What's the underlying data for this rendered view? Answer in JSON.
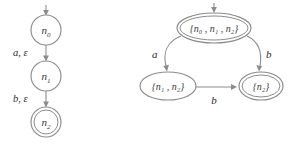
{
  "figure": {
    "title": "",
    "stroke_color": "#8c8c8c",
    "text_color": "#2b2b2b",
    "background": "#ffffff"
  },
  "diagrams": [
    {
      "id": "nfa-epsilon",
      "name": "left-nfa-diagram",
      "states": [
        {
          "id": "n0",
          "label": "n",
          "sub": "0",
          "accepting": false,
          "start": true,
          "cx": 46,
          "cy": 30,
          "r": 15
        },
        {
          "id": "n1",
          "label": "n",
          "sub": "1",
          "accepting": false,
          "start": false,
          "cx": 46,
          "cy": 76,
          "r": 15
        },
        {
          "id": "n2",
          "label": "n",
          "sub": "2",
          "accepting": true,
          "start": false,
          "cx": 46,
          "cy": 122,
          "r": 15
        }
      ],
      "transitions": [
        {
          "from": "n0",
          "to": "n1",
          "label": "a, ε",
          "label_x": 13,
          "label_y": 54
        },
        {
          "from": "n1",
          "to": "n2",
          "label": "b, ε",
          "label_x": 13,
          "label_y": 100
        }
      ]
    },
    {
      "id": "dfa-subset",
      "name": "right-dfa-diagram",
      "states": [
        {
          "id": "s0",
          "label": "{n₀ , n₁ , n₂}",
          "members": [
            "n0",
            "n1",
            "n2"
          ],
          "accepting": true,
          "start": true,
          "cx": 214,
          "cy": 28,
          "rx": 37,
          "ry": 15
        },
        {
          "id": "s1",
          "label": "{n₁ , n₂}",
          "members": [
            "n1",
            "n2"
          ],
          "accepting": false,
          "start": false,
          "cx": 168,
          "cy": 86,
          "rx": 28,
          "ry": 14
        },
        {
          "id": "s2",
          "label": "{n₂}",
          "members": [
            "n2"
          ],
          "accepting": true,
          "start": false,
          "cx": 261,
          "cy": 86,
          "rx": 22,
          "ry": 14
        }
      ],
      "transitions": [
        {
          "from": "s0",
          "to": "s1",
          "label": "a",
          "label_x": 157,
          "label_y": 54
        },
        {
          "from": "s0",
          "to": "s2",
          "label": "b",
          "label_x": 268,
          "label_y": 54
        },
        {
          "from": "s1",
          "to": "s2",
          "label": "b",
          "label_x": 214,
          "label_y": 103
        }
      ]
    }
  ],
  "labels": {
    "left_edge_1": "a, ε",
    "left_edge_2": "b, ε",
    "right_edge_a": "a",
    "right_edge_b_top": "b",
    "right_edge_b_bottom": "b",
    "n0": "n",
    "n1": "n",
    "n2": "n",
    "sub0": "0",
    "sub1": "1",
    "sub2": "2",
    "set_all": "{n₀ , n₁ , n₂}",
    "set_12": "{n₁ , n₂}",
    "set_2": "{n₂}"
  }
}
